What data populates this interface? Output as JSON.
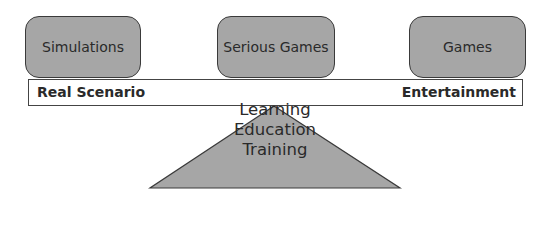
{
  "diagram": {
    "boxes": [
      {
        "label": "Simulations"
      },
      {
        "label": "Serious Games"
      },
      {
        "label": "Games"
      }
    ],
    "plank": {
      "left_label": "Real Scenario",
      "right_label": "Entertainment"
    },
    "fulcrum": {
      "lines": [
        "Learning",
        "Education",
        "Training"
      ]
    },
    "colors": {
      "box_fill": "#a6a6a6",
      "triangle_fill": "#a6a6a6",
      "stroke": "#3a3a3a"
    }
  }
}
